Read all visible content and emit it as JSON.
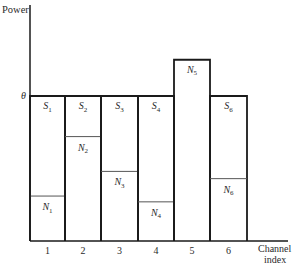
{
  "chart_data": {
    "type": "bar",
    "title": "",
    "xlabel": "Channel index",
    "ylabel": "Power",
    "water_level_label": "θ",
    "categories": [
      "1",
      "2",
      "3",
      "4",
      "5",
      "6"
    ],
    "series": [
      {
        "name": "Noise power N_k",
        "values": [
          0.31,
          0.72,
          0.48,
          0.27,
          1.25,
          0.43
        ]
      },
      {
        "name": "Signal power S_k",
        "values": [
          0.69,
          0.28,
          0.52,
          0.73,
          0,
          0.57
        ]
      }
    ],
    "water_level": 1.0,
    "ylim": [
      0,
      1.25
    ],
    "grid": false,
    "legend": "none",
    "bars": [
      {
        "index": "1",
        "signal_label": "S",
        "signal_sub": "1",
        "noise_label": "N",
        "noise_sub": "1",
        "noise": 0.31,
        "has_signal": true
      },
      {
        "index": "2",
        "signal_label": "S",
        "signal_sub": "2",
        "noise_label": "N",
        "noise_sub": "2",
        "noise": 0.72,
        "has_signal": true
      },
      {
        "index": "3",
        "signal_label": "S",
        "signal_sub": "3",
        "noise_label": "N",
        "noise_sub": "3",
        "noise": 0.48,
        "has_signal": true
      },
      {
        "index": "4",
        "signal_label": "S",
        "signal_sub": "4",
        "noise_label": "N",
        "noise_sub": "4",
        "noise": 0.27,
        "has_signal": true
      },
      {
        "index": "5",
        "signal_label": "",
        "signal_sub": "",
        "noise_label": "N",
        "noise_sub": "5",
        "noise": 1.25,
        "has_signal": false
      },
      {
        "index": "6",
        "signal_label": "S",
        "signal_sub": "6",
        "noise_label": "N",
        "noise_sub": "6",
        "noise": 0.43,
        "has_signal": true
      }
    ],
    "xlabel_lines": [
      "Channel",
      "index"
    ]
  },
  "colors": {
    "axis": "#1a1a1a",
    "bar_outline": "#1a1a1a",
    "noise_line": "#555555",
    "text": "#2a2a2a"
  }
}
